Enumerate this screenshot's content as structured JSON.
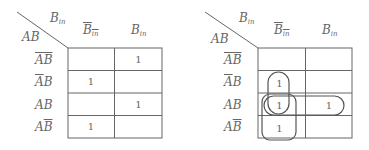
{
  "diagram": {
    "type": "karnaugh-map",
    "line_color": "#666666",
    "maps": [
      {
        "id": "kmap-plain",
        "corner": {
          "row_var": "AB",
          "col_var": "B",
          "col_var_sub": "in"
        },
        "columns": [
          {
            "base": "B",
            "sub": "in",
            "complement": true
          },
          {
            "base": "B",
            "sub": "in",
            "complement": false
          }
        ],
        "rows": [
          {
            "label": "AB",
            "overline": "AB"
          },
          {
            "label": "AB",
            "overline": "A"
          },
          {
            "label": "AB",
            "overline": ""
          },
          {
            "label": "AB",
            "overline": "B"
          }
        ],
        "cells": [
          [
            "",
            "1"
          ],
          [
            "1",
            ""
          ],
          [
            "",
            "1"
          ],
          [
            "1",
            ""
          ]
        ]
      },
      {
        "id": "kmap-grouped",
        "corner": {
          "row_var": "AB",
          "col_var": "B",
          "col_var_sub": "in"
        },
        "columns": [
          {
            "base": "B",
            "sub": "in",
            "complement": true
          },
          {
            "base": "B",
            "sub": "in",
            "complement": false
          }
        ],
        "rows": [
          {
            "label": "AB",
            "overline": "AB"
          },
          {
            "label": "AB",
            "overline": "A"
          },
          {
            "label": "AB",
            "overline": ""
          },
          {
            "label": "AB",
            "overline": "B"
          }
        ],
        "cells": [
          [
            "",
            ""
          ],
          [
            "1",
            ""
          ],
          [
            "1",
            "1"
          ],
          [
            "1",
            ""
          ]
        ],
        "groups": [
          {
            "name": "group-col1-rows2-3",
            "covers": "rows 2-3, column 1"
          },
          {
            "name": "group-col1-rows3-4",
            "covers": "rows 3-4, column 1"
          },
          {
            "name": "group-row3-cols1-2",
            "covers": "row 3, columns 1-2"
          }
        ]
      }
    ]
  },
  "text": {
    "m0": {
      "corner_col": "B",
      "corner_col_sub": "in",
      "corner_row": "AB",
      "col0": "B",
      "col0_sub": "in",
      "col1": "B",
      "col1_sub": "in",
      "r0": "AB",
      "r1a": "A",
      "r1b": "B",
      "r2": "AB",
      "r3a": "A",
      "r3b": "B",
      "c": [
        [
          "",
          "1"
        ],
        [
          "1",
          ""
        ],
        [
          "",
          "1"
        ],
        [
          "1",
          ""
        ]
      ]
    },
    "m1": {
      "corner_col": "B",
      "corner_col_sub": "in",
      "corner_row": "AB",
      "col0": "B",
      "col0_sub": "in",
      "col1": "B",
      "col1_sub": "in",
      "r0": "AB",
      "r1a": "A",
      "r1b": "B",
      "r2": "AB",
      "r3a": "A",
      "r3b": "B",
      "c": [
        [
          "",
          ""
        ],
        [
          "1",
          ""
        ],
        [
          "1",
          "1"
        ],
        [
          "1",
          ""
        ]
      ]
    }
  }
}
